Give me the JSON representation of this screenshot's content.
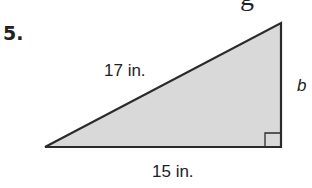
{
  "problem": {
    "number": "5.",
    "partial_header_glyph": "g"
  },
  "triangle": {
    "type": "right",
    "hypotenuse_label": "17 in.",
    "base_label": "15 in.",
    "leg_label": "b",
    "fill_color": "#d9d9d9",
    "stroke_color": "#2b2b2b"
  }
}
